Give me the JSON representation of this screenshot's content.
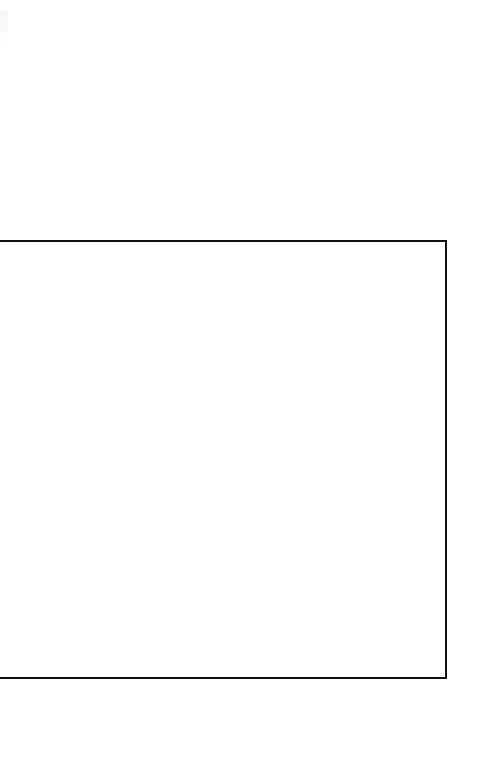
{
  "header": {
    "faint_text": ""
  },
  "frame": {
    "border_color": "#111111",
    "background": "#ffffff",
    "content": ""
  }
}
